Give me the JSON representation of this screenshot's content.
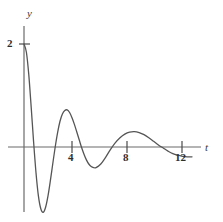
{
  "figure": {
    "background_color": "#ffffff",
    "curve_color": "#555555",
    "axis_color": "#6b6b6b"
  },
  "axes": {
    "y_axis_label": "y",
    "t_axis_label": "t",
    "y_tick_labels": [
      "2"
    ],
    "t_tick_labels": [
      "4",
      "8",
      "12"
    ]
  },
  "chart_data": {
    "type": "line",
    "title": "",
    "xlabel": "t",
    "ylabel": "y",
    "xlim": [
      -0.6,
      14.6
    ],
    "ylim": [
      -1.6,
      2.4
    ],
    "grid": false,
    "legend": null,
    "xticks": [
      4,
      8,
      12
    ],
    "xtick_labels": [
      "4",
      "8",
      "12"
    ],
    "yticks": [
      2
    ],
    "ytick_labels": [
      "2"
    ],
    "series": [
      {
        "name": "damped oscillation",
        "color": "#555555",
        "x": [
          0.0,
          0.2,
          0.4,
          0.6,
          0.8,
          1.0,
          1.2,
          1.4,
          1.6,
          1.8,
          2.0,
          2.2,
          2.4,
          2.6,
          2.8,
          3.0,
          3.2,
          3.4,
          3.6,
          3.8,
          4.0,
          4.2,
          4.4,
          4.6,
          4.8,
          5.0,
          5.2,
          5.4,
          5.6,
          5.8,
          6.0,
          6.4,
          6.8,
          7.2,
          7.6,
          8.0,
          8.4,
          8.8,
          9.2,
          9.6,
          10.0,
          10.4,
          10.8,
          11.2,
          11.6,
          12.0,
          12.4,
          12.8,
          13.2,
          13.6,
          14.0
        ],
        "y": [
          2.0,
          1.84,
          1.4,
          0.77,
          0.1,
          -0.5,
          -0.95,
          -1.2,
          -1.27,
          -1.17,
          -0.95,
          -0.65,
          -0.32,
          0.0,
          0.28,
          0.5,
          0.64,
          0.71,
          0.72,
          0.67,
          0.57,
          0.44,
          0.29,
          0.14,
          -0.01,
          -0.14,
          -0.25,
          -0.33,
          -0.38,
          -0.4,
          -0.4,
          -0.33,
          -0.2,
          -0.05,
          0.08,
          0.18,
          0.25,
          0.29,
          0.3,
          0.28,
          0.24,
          0.18,
          0.11,
          0.04,
          -0.02,
          -0.08,
          -0.13,
          -0.16,
          -0.18,
          -0.19,
          -0.19
        ]
      }
    ],
    "key_points": {
      "initial_value": 2.0,
      "first_minimum": {
        "t": 1.7,
        "y": -1.28
      },
      "first_maximum": {
        "t": 3.7,
        "y": 0.72
      },
      "second_minimum": {
        "t": 5.9,
        "y": -0.4
      },
      "second_maximum": {
        "t": 9.2,
        "y": 0.3
      },
      "zero_crossings": [
        0.85,
        2.6,
        4.75,
        7.45,
        11.5
      ]
    }
  }
}
